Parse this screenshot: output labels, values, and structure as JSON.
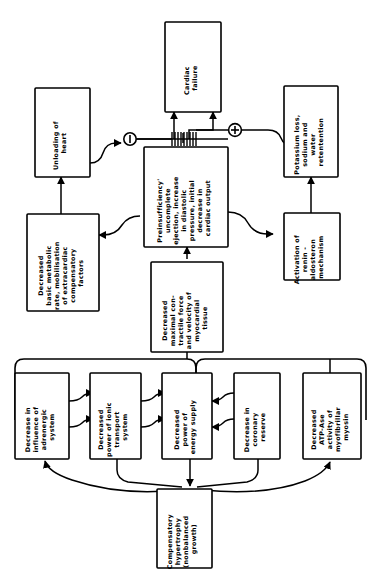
{
  "diagram": {
    "orientation": "rotated-90-ccw",
    "stroke_color": "#000000",
    "background_color": "#ffffff",
    "nodes": [
      {
        "id": "cardiac-failure",
        "lines": [
          "Cardiac",
          "failure"
        ]
      },
      {
        "id": "unloading-of-heart",
        "lines": [
          "Unloading of",
          "heart"
        ]
      },
      {
        "id": "potassium-loss",
        "lines": [
          "Potassium loss,",
          "sodium and",
          "water",
          "retentention"
        ]
      },
      {
        "id": "preinsufficiency",
        "lines": [
          "Preinsufficiency'",
          "uncomplete",
          "ejection, increase",
          "in diastolic",
          "pressure, initial",
          "decrease in",
          "cardiac output"
        ]
      },
      {
        "id": "decreased-basic-metabolic-rate",
        "lines": [
          "Decreased",
          "basic metabolic",
          "rate, mobilisation",
          "of extracardiac",
          "compensatory",
          "factors"
        ]
      },
      {
        "id": "activation-renin-aldosteron",
        "lines": [
          "Activation of",
          "renin -",
          "aldosteron",
          "mechanism"
        ]
      },
      {
        "id": "decreased-maximal-contractile-force",
        "lines": [
          "Decreased",
          "maximal con-",
          "tractile force",
          "and velocity of",
          "myocardial",
          "tissue"
        ]
      },
      {
        "id": "decrease-adrenergic-influence",
        "lines": [
          "Decrease in",
          "influence of",
          "adrenergic",
          "system"
        ]
      },
      {
        "id": "decreased-ionic-transport",
        "lines": [
          "Decreased",
          "power of ionic",
          "transport",
          "system"
        ]
      },
      {
        "id": "decreased-energy-supply",
        "lines": [
          "Decreased",
          "power of",
          "energy supply"
        ]
      },
      {
        "id": "decrease-coronary-reserve",
        "lines": [
          "Decrease in",
          "coronary",
          "reserve"
        ]
      },
      {
        "id": "decreased-atpase-myosin",
        "lines": [
          "Decreased",
          "ATP-Ase",
          "activity of",
          "myofibrillar",
          "myosin"
        ]
      },
      {
        "id": "compensatory-hypertrophy",
        "lines": [
          "Compensatory",
          "hypertrophy",
          "(nonbalanced",
          "growth)"
        ]
      }
    ],
    "symbols": [
      {
        "id": "minus-symbol",
        "glyph": "−",
        "meaning": "negative-feedback"
      },
      {
        "id": "plus-symbol",
        "glyph": "+",
        "meaning": "positive-feedback"
      },
      {
        "id": "comb-hatch-symbol",
        "glyph": "||||||",
        "meaning": "summation-junction"
      }
    ]
  }
}
